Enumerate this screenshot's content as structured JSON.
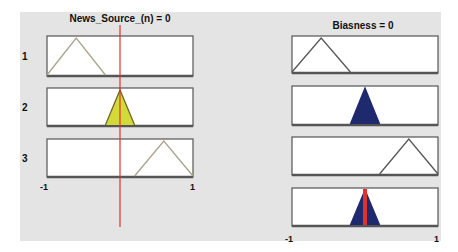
{
  "chart_data": {
    "type": "fuzzy-rule-viewer",
    "input": {
      "title": "News_Source_(n) = 0",
      "name": "News_Source_(n)",
      "value": 0,
      "range": [
        -1,
        1
      ],
      "tick_labels": [
        "-1",
        "1"
      ],
      "rows": [
        {
          "label": "1",
          "mf": [
            -1,
            -0.6,
            -0.2
          ],
          "fired": false
        },
        {
          "label": "2",
          "mf": [
            -0.2,
            0,
            0.2
          ],
          "fired": true
        },
        {
          "label": "3",
          "mf": [
            0.2,
            0.6,
            1
          ],
          "fired": false
        }
      ]
    },
    "output": {
      "title": "Biasness = 0",
      "name": "Biasness",
      "value": 0,
      "range": [
        -1,
        1
      ],
      "tick_labels": [
        "-1",
        "1"
      ],
      "rows": [
        {
          "mf": [
            -1,
            -0.6,
            -0.2
          ],
          "fired": false
        },
        {
          "mf": [
            -0.2,
            0,
            0.2
          ],
          "fired": true
        },
        {
          "mf": [
            0.2,
            0.6,
            1
          ],
          "fired": false
        }
      ],
      "aggregate": {
        "mf": [
          -0.2,
          0,
          0.2
        ]
      }
    },
    "colors": {
      "input_fill": "#d4d93a",
      "output_fill": "#1f2a6e",
      "mf_line": "#a8a48a",
      "out_line": "#555555",
      "indicator": "#e0312b"
    }
  }
}
